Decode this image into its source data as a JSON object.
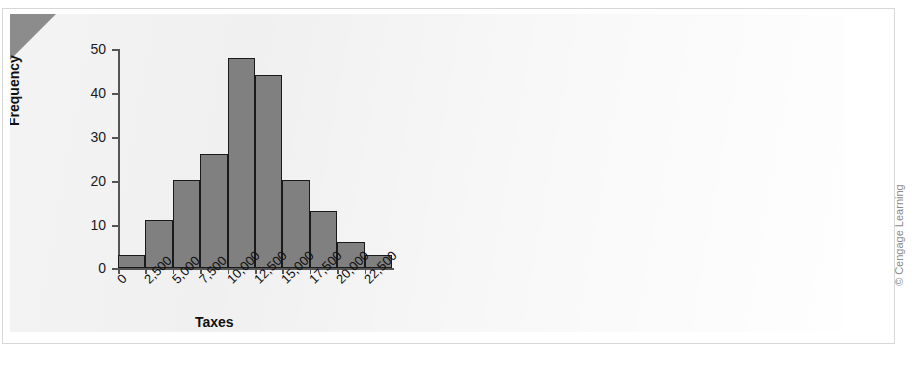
{
  "figure": {
    "title_partial": "",
    "attribution": "© Cengage Learning",
    "corner_fold_color": "#8c8c8c",
    "plate_color": "#f0f0f0"
  },
  "chart_data": {
    "type": "bar",
    "title": "",
    "subtitle": "",
    "xlabel": "Taxes",
    "ylabel": "Frequency",
    "categories": [
      "0",
      "2,500",
      "5,000",
      "7,500",
      "10,000",
      "12,500",
      "15,000",
      "17,500",
      "20,000",
      "22,500"
    ],
    "values": [
      3,
      11,
      20,
      26,
      48,
      44,
      20,
      13,
      6,
      3
    ],
    "bin_width": 2500,
    "bin_starts": [
      0,
      2500,
      5000,
      7500,
      10000,
      12500,
      15000,
      17500,
      20000,
      22500
    ],
    "ylim": [
      0,
      50
    ],
    "yticks": [
      0,
      10,
      20,
      30,
      40,
      50
    ],
    "ytick_labels": [
      "0",
      "10",
      "20",
      "30",
      "40",
      "50"
    ],
    "xtick_labels": [
      "0",
      "2,500",
      "5,000",
      "7,500",
      "10,000",
      "12,500",
      "15,000",
      "17,500",
      "20,000",
      "22,500"
    ],
    "grid": false,
    "legend": null,
    "bar_fill": "#808080",
    "bar_edge": "#1a1a1a",
    "xtick_label_rotation": -45
  }
}
